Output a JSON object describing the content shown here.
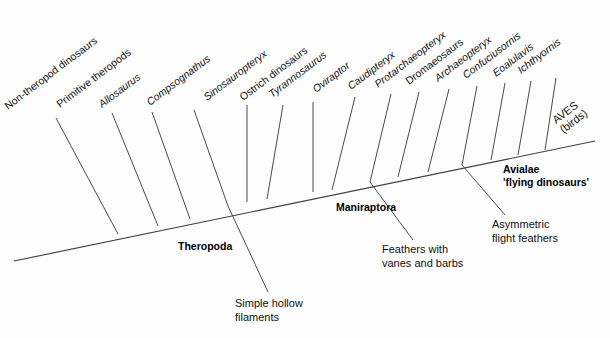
{
  "diagram": {
    "type": "cladogram",
    "background_color": "#fdfdfd",
    "line_color": "#4a4a4a",
    "text_color": "#111111"
  },
  "taxa": [
    {
      "id": "non-theropod-dinosaurs",
      "label": "Non-theropod dinosaurs",
      "style": "upright",
      "tip": {
        "x": 56,
        "y": 118
      },
      "node": {
        "x": 118,
        "y": 234
      },
      "label_anchor": {
        "x": 8,
        "y": 110
      }
    },
    {
      "id": "primitive-theropods",
      "label": "Primitive theropods",
      "style": "upright",
      "tip": {
        "x": 112,
        "y": 113
      },
      "node": {
        "x": 158,
        "y": 226
      },
      "label_anchor": {
        "x": 60,
        "y": 108
      }
    },
    {
      "id": "allosaurus",
      "label": "Allosaurus",
      "style": "italic",
      "tip": {
        "x": 152,
        "y": 112
      },
      "node": {
        "x": 190,
        "y": 219
      },
      "label_anchor": {
        "x": 102,
        "y": 108
      }
    },
    {
      "id": "compsognathus",
      "label": "Compsognathus",
      "style": "italic",
      "tip": {
        "x": 194,
        "y": 110
      },
      "node": {
        "x": 228,
        "y": 206
      },
      "label_anchor": {
        "x": 150,
        "y": 106
      }
    },
    {
      "id": "sinosauropteryx",
      "label": "Sinosauropteryx",
      "style": "italic",
      "tip": {
        "x": 247,
        "y": 105
      },
      "node": {
        "x": 247,
        "y": 202
      },
      "label_anchor": {
        "x": 207,
        "y": 101
      }
    },
    {
      "id": "ostrich-dinosaurs",
      "label": "Ostrich dinosaurs",
      "style": "upright",
      "tip": {
        "x": 283,
        "y": 105
      },
      "node": {
        "x": 267,
        "y": 199
      },
      "label_anchor": {
        "x": 243,
        "y": 101
      }
    },
    {
      "id": "tyrannosaurus",
      "label": "Tyrannosaurus",
      "style": "italic",
      "tip": {
        "x": 313,
        "y": 102
      },
      "node": {
        "x": 313,
        "y": 192
      },
      "label_anchor": {
        "x": 272,
        "y": 98
      }
    },
    {
      "id": "oviraptor",
      "label": "Oviraptor",
      "style": "italic",
      "tip": {
        "x": 355,
        "y": 97
      },
      "node": {
        "x": 332,
        "y": 190
      },
      "label_anchor": {
        "x": 316,
        "y": 93
      }
    },
    {
      "id": "caudipteryx",
      "label": "Caudipteryx",
      "style": "italic",
      "tip": {
        "x": 391,
        "y": 94
      },
      "node": {
        "x": 370,
        "y": 182
      },
      "label_anchor": {
        "x": 351,
        "y": 90
      }
    },
    {
      "id": "protarchaeopteryx",
      "label": "Protarchaeopteryx",
      "style": "italic",
      "tip": {
        "x": 419,
        "y": 92
      },
      "node": {
        "x": 398,
        "y": 177
      },
      "label_anchor": {
        "x": 378,
        "y": 88
      }
    },
    {
      "id": "dromaeosaurs",
      "label": "Dromaeosaurs",
      "style": "upright",
      "tip": {
        "x": 449,
        "y": 89
      },
      "node": {
        "x": 428,
        "y": 172
      },
      "label_anchor": {
        "x": 409,
        "y": 85
      }
    },
    {
      "id": "archaeopteryx",
      "label": "Archaeopteryx",
      "style": "italic",
      "tip": {
        "x": 477,
        "y": 86
      },
      "node": {
        "x": 462,
        "y": 165
      },
      "label_anchor": {
        "x": 438,
        "y": 82
      }
    },
    {
      "id": "confuciusornis",
      "label": "Confuciusornis",
      "style": "italic",
      "tip": {
        "x": 505,
        "y": 83
      },
      "node": {
        "x": 491,
        "y": 160
      },
      "label_anchor": {
        "x": 466,
        "y": 79
      }
    },
    {
      "id": "eoalulavis",
      "label": "Eoalulavis",
      "style": "italic",
      "tip": {
        "x": 531,
        "y": 81
      },
      "node": {
        "x": 518,
        "y": 155
      },
      "label_anchor": {
        "x": 496,
        "y": 77
      }
    },
    {
      "id": "ichthyornis",
      "label": "Ichthyornis",
      "style": "italic",
      "tip": {
        "x": 556,
        "y": 78
      },
      "node": {
        "x": 545,
        "y": 150
      },
      "label_anchor": {
        "x": 521,
        "y": 74
      }
    }
  ],
  "backbone": {
    "start": {
      "x": 14,
      "y": 261
    },
    "end": {
      "x": 595,
      "y": 141
    }
  },
  "terminal": {
    "aves_line1": "AVES",
    "aves_line2": "(birds)",
    "aves_anchor": {
      "x": 556,
      "y": 124
    },
    "tip": {
      "x": 595,
      "y": 141
    }
  },
  "clades": [
    {
      "id": "theropoda",
      "label": "Theropoda",
      "x": 178,
      "y": 250
    },
    {
      "id": "maniraptora",
      "label": "Maniraptora",
      "x": 336,
      "y": 211
    },
    {
      "id": "avialae",
      "label": "Avialae",
      "label2": "'flying dinosaurs'",
      "x": 503,
      "y": 173
    }
  ],
  "annotations": [
    {
      "id": "simple-hollow-filaments",
      "line1": "Simple hollow",
      "line2": "filaments",
      "text_x": 235,
      "text_y": 307,
      "leader_from": {
        "x": 228,
        "y": 206
      },
      "leader_to": {
        "x": 268,
        "y": 292
      }
    },
    {
      "id": "feathers-with-vanes-and-barbs",
      "line1": "Feathers with",
      "line2": "vanes and barbs",
      "text_x": 382,
      "text_y": 253,
      "leader_from": {
        "x": 370,
        "y": 182
      },
      "leader_to": {
        "x": 413,
        "y": 240
      }
    },
    {
      "id": "asymmetric-flight-feathers",
      "line1": "Asymmetric",
      "line2": "flight feathers",
      "text_x": 492,
      "text_y": 228,
      "leader_from": {
        "x": 462,
        "y": 165
      },
      "leader_to": {
        "x": 505,
        "y": 215
      }
    }
  ],
  "label_rotation_deg": -37
}
